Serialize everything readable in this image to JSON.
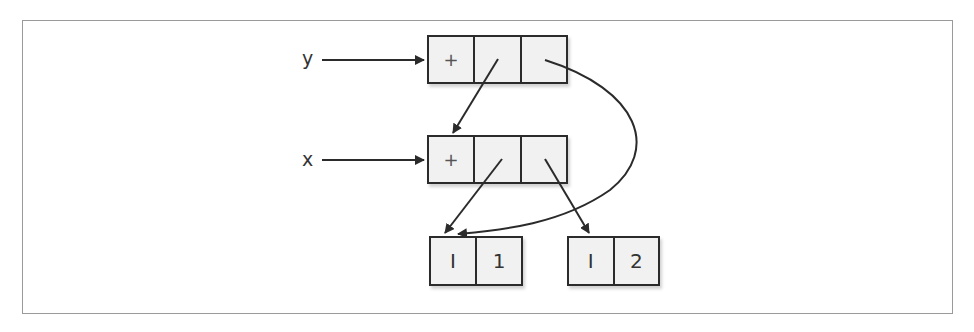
{
  "diagram": {
    "type": "reference-structure",
    "variables": [
      {
        "name": "y",
        "points_to": "node_y"
      },
      {
        "name": "x",
        "points_to": "node_x"
      }
    ],
    "nodes": {
      "node_y": {
        "cells": [
          "+",
          "",
          ""
        ]
      },
      "node_x": {
        "cells": [
          "+",
          "",
          ""
        ]
      },
      "int_1": {
        "cells": [
          "I",
          "1"
        ]
      },
      "int_2": {
        "cells": [
          "I",
          "2"
        ]
      }
    },
    "edges": [
      {
        "from": "y",
        "to": "node_y.cell0"
      },
      {
        "from": "x",
        "to": "node_x.cell0"
      },
      {
        "from": "node_y.cell1",
        "to": "node_x.cell0"
      },
      {
        "from": "node_y.cell2",
        "to": "int_1.cell0",
        "shape": "curve"
      },
      {
        "from": "node_x.cell1",
        "to": "int_1.cell0"
      },
      {
        "from": "node_x.cell2",
        "to": "int_2.cell0"
      }
    ],
    "colors": {
      "stroke": "#2b2b2b",
      "cell_fill": "#f1f1f1",
      "frame": "#9a9a9a"
    }
  }
}
